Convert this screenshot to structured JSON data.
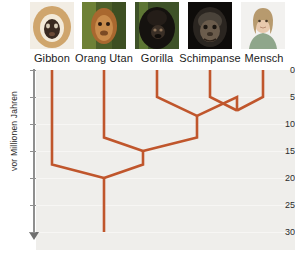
{
  "figure": {
    "axis_title": "vor Millionen Jahren",
    "line_color": "#c0562c",
    "plot_background": "#efeeeb",
    "axis_color": "#8f8f8f"
  },
  "species": [
    {
      "name": "Gibbon",
      "label": "Gibbon",
      "photo": "gibbon-photo",
      "x": 52,
      "tip_age": 0
    },
    {
      "name": "OrangUtan",
      "label": "Orang Utan",
      "photo": "orang-utan-photo",
      "x": 104,
      "tip_age": 0
    },
    {
      "name": "Gorilla",
      "label": "Gorilla",
      "photo": "gorilla-photo",
      "x": 157,
      "tip_age": 0
    },
    {
      "name": "Schimpanse",
      "label": "Schimpanse",
      "photo": "chimpanzee-photo",
      "x": 210,
      "tip_age": 0
    },
    {
      "name": "Mensch",
      "label": "Mensch",
      "photo": "human-photo",
      "x": 263,
      "tip_age": 0
    }
  ],
  "axis": {
    "ticks": [
      0,
      5,
      10,
      15,
      20,
      25,
      30
    ],
    "tick_labels": [
      "0",
      "5",
      "10",
      "15",
      "20",
      "25",
      "30"
    ],
    "range": [
      0,
      30
    ],
    "unit": "million years ago",
    "direction": "downward"
  },
  "chart_data": {
    "type": "line",
    "title": "",
    "subtitle": "",
    "xlabel": "",
    "ylabel": "vor Millionen Jahren",
    "ylim": [
      0,
      30
    ],
    "grid": true,
    "legend": "none",
    "chart_kind": "phylogenetic-tree",
    "taxa": [
      "Gibbon",
      "Orang Utan",
      "Gorilla",
      "Schimpanse",
      "Mensch"
    ],
    "taxa_x": [
      52,
      104,
      157,
      210,
      263
    ],
    "divergence_nodes": [
      {
        "id": "node-schimpanse-mensch",
        "age": 7.5,
        "x": 237,
        "children": [
          "Schimpanse",
          "Mensch"
        ],
        "bend_age": 5.0
      },
      {
        "id": "node-gorilla-clade",
        "age": 8.5,
        "x": 197,
        "children": [
          "Gorilla",
          "node-schimpanse-mensch"
        ],
        "bend_age": 5.0
      },
      {
        "id": "node-orangutan-clade",
        "age": 15.0,
        "x": 143,
        "children": [
          "Orang Utan",
          "node-gorilla-clade"
        ],
        "bend_age": 12.5
      },
      {
        "id": "node-gibbon-root",
        "age": 20.0,
        "x": 104,
        "children": [
          "Gibbon",
          "node-orangutan-clade"
        ],
        "bend_age": 17.5
      }
    ],
    "root_stem": {
      "x": 104,
      "from_age": 20.0,
      "to_age": 30.0
    },
    "values": [
      7.5,
      8.5,
      15.0,
      20.0
    ],
    "categories": [
      "Schimpanse/Mensch",
      "Gorilla",
      "Orang Utan",
      "Gibbon"
    ]
  }
}
